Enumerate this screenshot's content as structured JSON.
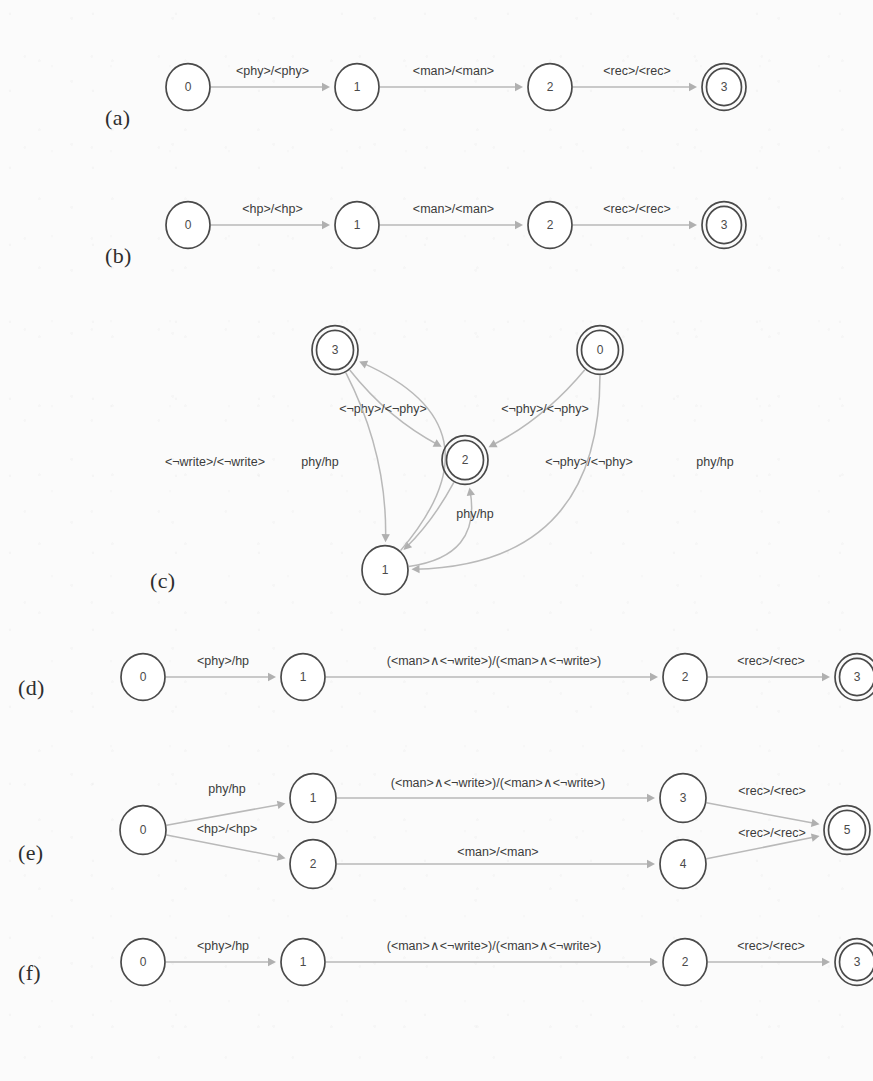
{
  "figure": {
    "background_color": "#fbfbfb",
    "node_stroke_color": "#4a4a4a",
    "edge_color": "#b9b9b9",
    "label_color": "#3c3c3c"
  },
  "panels": [
    {
      "id": "a",
      "caption": "(a)",
      "layout": "linear",
      "nodes": [
        {
          "id": "a0",
          "label": "0",
          "accepting": false,
          "cx": 88,
          "cy": 37,
          "r": 22
        },
        {
          "id": "a1",
          "label": "1",
          "accepting": false,
          "cx": 257,
          "cy": 37,
          "r": 22
        },
        {
          "id": "a2",
          "label": "2",
          "accepting": false,
          "cx": 450,
          "cy": 37,
          "r": 22
        },
        {
          "id": "a3",
          "label": "3",
          "accepting": true,
          "cx": 624,
          "cy": 37,
          "r": 22
        }
      ],
      "edges": [
        {
          "from": "a0",
          "to": "a1",
          "label": "<phy>/<phy>"
        },
        {
          "from": "a1",
          "to": "a2",
          "label": "<man>/<man>"
        },
        {
          "from": "a2",
          "to": "a3",
          "label": "<rec>/<rec>"
        }
      ]
    },
    {
      "id": "b",
      "caption": "(b)",
      "layout": "linear",
      "nodes": [
        {
          "id": "b0",
          "label": "0",
          "accepting": false,
          "cx": 88,
          "cy": 37,
          "r": 22
        },
        {
          "id": "b1",
          "label": "1",
          "accepting": false,
          "cx": 257,
          "cy": 37,
          "r": 22
        },
        {
          "id": "b2",
          "label": "2",
          "accepting": false,
          "cx": 450,
          "cy": 37,
          "r": 22
        },
        {
          "id": "b3",
          "label": "3",
          "accepting": true,
          "cx": 624,
          "cy": 37,
          "r": 22
        }
      ],
      "edges": [
        {
          "from": "b0",
          "to": "b1",
          "label": "<hp>/<hp>"
        },
        {
          "from": "b1",
          "to": "b2",
          "label": "<man>/<man>"
        },
        {
          "from": "b2",
          "to": "b3",
          "label": "<rec>/<rec>"
        }
      ]
    },
    {
      "id": "c",
      "caption": "(c)",
      "layout": "graph",
      "nodes": [
        {
          "id": "c3",
          "label": "3",
          "accepting": true,
          "cx": 220,
          "cy": 35,
          "r": 23
        },
        {
          "id": "c0",
          "label": "0",
          "accepting": true,
          "cx": 485,
          "cy": 35,
          "r": 23
        },
        {
          "id": "c2",
          "label": "2",
          "accepting": true,
          "cx": 350,
          "cy": 145,
          "r": 23
        },
        {
          "id": "c1",
          "label": "1",
          "accepting": false,
          "cx": 270,
          "cy": 255,
          "r": 23
        }
      ],
      "edges": [
        {
          "from": "c3",
          "to": "c2",
          "label": "<¬phy>/<¬phy>",
          "label_x": 268,
          "label_y": 95
        },
        {
          "from": "c0",
          "to": "c2",
          "label": "<¬phy>/<¬phy>",
          "label_x": 430,
          "label_y": 95
        },
        {
          "from": "c1",
          "to": "c2",
          "label": "<¬phy>/<¬phy>",
          "label_x": 474,
          "label_y": 148
        },
        {
          "from": "c3",
          "to": "c1",
          "label": "phy/hp",
          "label_x": 205,
          "label_y": 148
        },
        {
          "from": "c2",
          "to": "c1",
          "label": "phy/hp",
          "label_x": 360,
          "label_y": 200
        },
        {
          "from": "c0",
          "to": "c1",
          "label": "phy/hp",
          "label_x": 600,
          "label_y": 148
        },
        {
          "from": "c1",
          "to": "c3",
          "label": "<¬write>/<¬write>",
          "label_x": 100,
          "label_y": 148
        }
      ]
    },
    {
      "id": "d",
      "caption": "(d)",
      "layout": "linear",
      "nodes": [
        {
          "id": "d0",
          "label": "0",
          "accepting": false,
          "cx": 68,
          "cy": 37,
          "r": 22
        },
        {
          "id": "d1",
          "label": "1",
          "accepting": false,
          "cx": 228,
          "cy": 37,
          "r": 22
        },
        {
          "id": "d2",
          "label": "2",
          "accepting": false,
          "cx": 610,
          "cy": 37,
          "r": 22
        },
        {
          "id": "d3",
          "label": "3",
          "accepting": true,
          "cx": 782,
          "cy": 37,
          "r": 22
        }
      ],
      "edges": [
        {
          "from": "d0",
          "to": "d1",
          "label": "<phy>/hp"
        },
        {
          "from": "d1",
          "to": "d2",
          "label": "(<man>∧<¬write>)/(<man>∧<¬write>)"
        },
        {
          "from": "d2",
          "to": "d3",
          "label": "<rec>/<rec>"
        }
      ]
    },
    {
      "id": "e",
      "caption": "(e)",
      "layout": "branching",
      "nodes": [
        {
          "id": "e0",
          "label": "0",
          "accepting": false,
          "cx": 68,
          "cy": 62,
          "r": 23
        },
        {
          "id": "e1",
          "label": "1",
          "accepting": false,
          "cx": 238,
          "cy": 30,
          "r": 23
        },
        {
          "id": "e2",
          "label": "2",
          "accepting": false,
          "cx": 238,
          "cy": 96,
          "r": 23
        },
        {
          "id": "e3",
          "label": "3",
          "accepting": false,
          "cx": 608,
          "cy": 30,
          "r": 23
        },
        {
          "id": "e4",
          "label": "4",
          "accepting": false,
          "cx": 608,
          "cy": 96,
          "r": 23
        },
        {
          "id": "e5",
          "label": "5",
          "accepting": true,
          "cx": 772,
          "cy": 62,
          "r": 23
        }
      ],
      "edges": [
        {
          "from": "e0",
          "to": "e1",
          "label": "phy/hp",
          "label_x": 152,
          "label_y": 22
        },
        {
          "from": "e0",
          "to": "e2",
          "label": "<hp>/<hp>",
          "label_x": 152,
          "label_y": 62
        },
        {
          "from": "e1",
          "to": "e3",
          "label": "(<man>∧<¬write>)/(<man>∧<¬write>)",
          "label_x": 423,
          "label_y": 16
        },
        {
          "from": "e2",
          "to": "e4",
          "label": "<man>/<man>",
          "label_x": 423,
          "label_y": 85
        },
        {
          "from": "e3",
          "to": "e5",
          "label": "<rec>/<rec>",
          "label_x": 697,
          "label_y": 24
        },
        {
          "from": "e4",
          "to": "e5",
          "label": "<rec>/<rec>",
          "label_x": 697,
          "label_y": 66
        }
      ]
    },
    {
      "id": "f",
      "caption": "(f)",
      "layout": "linear",
      "nodes": [
        {
          "id": "f0",
          "label": "0",
          "accepting": false,
          "cx": 68,
          "cy": 37,
          "r": 22
        },
        {
          "id": "f1",
          "label": "1",
          "accepting": false,
          "cx": 228,
          "cy": 37,
          "r": 22
        },
        {
          "id": "f2",
          "label": "2",
          "accepting": false,
          "cx": 610,
          "cy": 37,
          "r": 22
        },
        {
          "id": "f3",
          "label": "3",
          "accepting": true,
          "cx": 782,
          "cy": 37,
          "r": 22
        }
      ],
      "edges": [
        {
          "from": "f0",
          "to": "f1",
          "label": "<phy>/hp"
        },
        {
          "from": "f1",
          "to": "f2",
          "label": "(<man>∧<¬write>)/(<man>∧<¬write>)"
        },
        {
          "from": "f2",
          "to": "f3",
          "label": "<rec>/<rec>"
        }
      ]
    }
  ],
  "panel_frames": {
    "a": {
      "left": 100,
      "top": 50,
      "width": 760,
      "height": 80,
      "caption_left": 105,
      "caption_top": 105
    },
    "b": {
      "left": 100,
      "top": 188,
      "width": 760,
      "height": 80,
      "caption_left": 105,
      "caption_top": 243
    },
    "c": {
      "left": 115,
      "top": 315,
      "width": 745,
      "height": 300,
      "caption_left": 150,
      "caption_top": 568
    },
    "d": {
      "left": 75,
      "top": 640,
      "width": 790,
      "height": 80,
      "caption_left": 18,
      "caption_top": 675
    },
    "e": {
      "left": 75,
      "top": 768,
      "width": 790,
      "height": 130,
      "caption_left": 18,
      "caption_top": 840
    },
    "f": {
      "left": 75,
      "top": 925,
      "width": 790,
      "height": 80,
      "caption_left": 18,
      "caption_top": 960
    }
  }
}
